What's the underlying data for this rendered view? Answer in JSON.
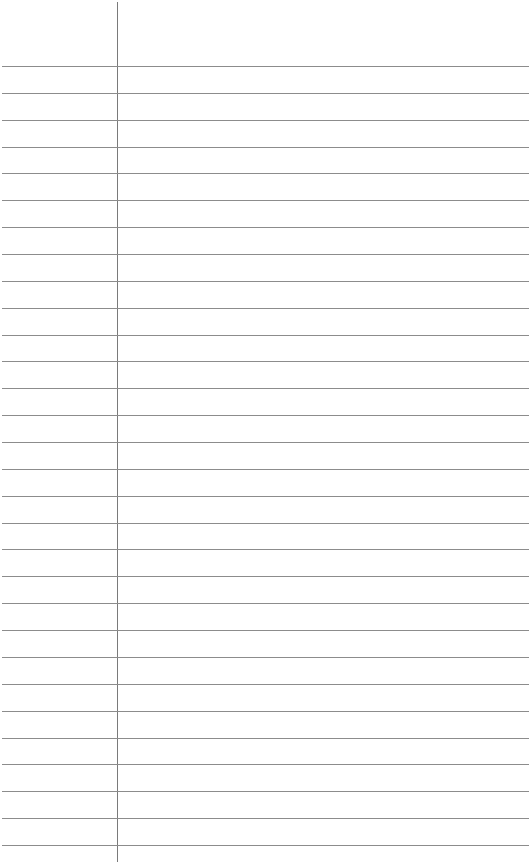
{
  "paper": {
    "type": "lined-paper",
    "line_color": "#8c8c8c",
    "margin_color": "#7a7a7a",
    "margin_x": 117,
    "first_line_y": 66,
    "line_spacing": 26.86,
    "line_count": 30
  }
}
